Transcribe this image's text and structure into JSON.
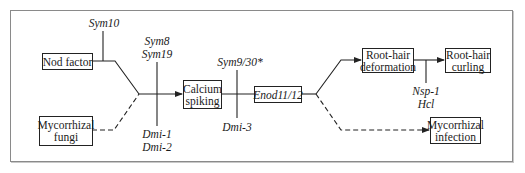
{
  "diagram": {
    "type": "signaling-pathway",
    "nodes": {
      "nod_factor": {
        "label": "Nod factor"
      },
      "mycorrhizal_fungi": {
        "line1": "Mycorrhizal",
        "line2": "fungi"
      },
      "calcium_spiking": {
        "line1": "Calcium",
        "line2": "spiking"
      },
      "enod": {
        "label": "Enod11/12"
      },
      "root_hair_deformation": {
        "line1": "Root-hair",
        "line2": "deformation"
      },
      "root_hair_curling": {
        "line1": "Root-hair",
        "line2": "curling"
      },
      "mycorrhizal_infection": {
        "line1": "Mycorrhizal",
        "line2": "infection"
      }
    },
    "genes": {
      "sym10": "Sym10",
      "sym8": "Sym8",
      "sym19": "Sym19",
      "dmi1": "Dmi-1",
      "dmi2": "Dmi-2",
      "sym9_30": "Sym9/30*",
      "dmi3": "Dmi-3",
      "nsp1": "Nsp-1",
      "hcl": "Hcl"
    },
    "edges": [
      {
        "from": "nod_factor",
        "to": "calcium_spiking",
        "style": "solid",
        "blocked_by": [
          "Sym10",
          "Sym8",
          "Sym19",
          "Dmi-1",
          "Dmi-2"
        ]
      },
      {
        "from": "mycorrhizal_fungi",
        "to": "calcium_spiking",
        "style": "dashed",
        "blocked_by": [
          "Sym8",
          "Sym19",
          "Dmi-1",
          "Dmi-2"
        ]
      },
      {
        "from": "calcium_spiking",
        "to": "enod",
        "style": "solid",
        "blocked_by": [
          "Sym9/30*",
          "Dmi-3"
        ]
      },
      {
        "from": "enod",
        "to": "root_hair_deformation",
        "style": "solid"
      },
      {
        "from": "root_hair_deformation",
        "to": "root_hair_curling",
        "style": "solid",
        "blocked_by": [
          "Nsp-1",
          "Hcl"
        ]
      },
      {
        "from": "enod",
        "to": "mycorrhizal_infection",
        "style": "dashed"
      }
    ],
    "colors": {
      "line": "#222222",
      "frame": "#8a8a8a",
      "background": "#ffffff"
    }
  }
}
